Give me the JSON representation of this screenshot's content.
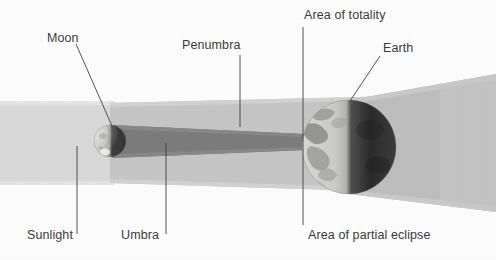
{
  "diagram": {
    "background_color": "#fdfdfd"
  },
  "labels": {
    "moon": "Moon",
    "penumbra": "Penumbra",
    "area_of_totality": "Area of totality",
    "earth": "Earth",
    "sunlight": "Sunlight",
    "umbra": "Umbra",
    "area_of_partial_eclipse": "Area of partial eclipse"
  },
  "bodies": {
    "moon": {
      "name": "Moon",
      "cx": 110,
      "cy": 141,
      "r": 16,
      "lit_color": "#c9c9c7",
      "dark_color": "#4a4a4a"
    },
    "earth": {
      "name": "Earth",
      "cx": 349,
      "cy": 147,
      "r": 47,
      "lit_color": "#cfcfcd",
      "dark_color": "#2f2f2f"
    }
  },
  "beams": {
    "sunlight": {
      "name": "Sunlight",
      "color": "#d9d9d9",
      "top": 103,
      "bottom": 183,
      "from_x": 0,
      "to_x": 110
    },
    "penumbra": {
      "name": "Penumbra",
      "color": "#c3c3c3",
      "near_top": 103,
      "near_bottom": 183,
      "far_top": 98,
      "far_bottom": 190
    },
    "umbra": {
      "name": "Umbra",
      "color": "#7e7e7e",
      "near_top": 126,
      "near_bottom": 157,
      "far_top": 134,
      "far_bottom": 150
    },
    "shadow_cone": {
      "name": "Shadow cone behind Earth",
      "color": "#bdbdbd",
      "near_top": 100,
      "near_bottom": 194,
      "far_top": 74,
      "far_bottom": 212,
      "from_x": 349,
      "to_x": 496
    }
  },
  "leader_lines": [
    {
      "name": "moon-leader",
      "x1": 76,
      "y1": 44,
      "x2": 112,
      "y2": 126
    },
    {
      "name": "penumbra-leader",
      "x1": 240,
      "y1": 55,
      "x2": 240,
      "y2": 127
    },
    {
      "name": "totality-leader",
      "x1": 303,
      "y1": 27,
      "x2": 303,
      "y2": 225
    },
    {
      "name": "earth-leader",
      "x1": 380,
      "y1": 56,
      "x2": 350,
      "y2": 100
    },
    {
      "name": "sunlight-leader",
      "x1": 77,
      "y1": 146,
      "x2": 77,
      "y2": 234
    },
    {
      "name": "umbra-leader",
      "x1": 166,
      "y1": 143,
      "x2": 166,
      "y2": 234
    }
  ],
  "colors": {
    "label_text": "#3a3a3a",
    "leader_line": "#404040",
    "page_background": "#fdfdfd"
  }
}
